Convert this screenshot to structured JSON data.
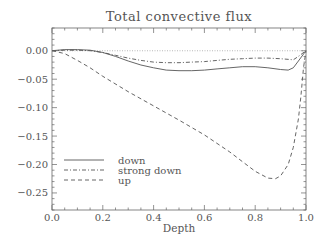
{
  "chart_data": {
    "type": "line",
    "title": "Total convective flux",
    "xlabel": "Depth",
    "ylabel": "",
    "xlim": [
      0.0,
      1.0
    ],
    "ylim": [
      -0.28,
      0.04
    ],
    "xticks": [
      "0.0",
      "0.2",
      "0.4",
      "0.6",
      "0.8",
      "1.0"
    ],
    "yticks": [
      "0.00",
      "-0.05",
      "-0.10",
      "-0.15",
      "-0.20",
      "-0.25"
    ],
    "grid": false,
    "legend_position": "lower left",
    "reference_line": {
      "y": 0.0,
      "style": "dotted"
    },
    "series": [
      {
        "name": "down",
        "style": "solid",
        "x": [
          0.0,
          0.05,
          0.1,
          0.15,
          0.2,
          0.25,
          0.3,
          0.35,
          0.4,
          0.45,
          0.5,
          0.55,
          0.6,
          0.65,
          0.7,
          0.75,
          0.8,
          0.85,
          0.9,
          0.93,
          0.95,
          0.97,
          1.0
        ],
        "values": [
          0.0,
          0.002,
          0.002,
          0.001,
          -0.003,
          -0.01,
          -0.018,
          -0.025,
          -0.03,
          -0.034,
          -0.035,
          -0.035,
          -0.034,
          -0.032,
          -0.03,
          -0.028,
          -0.028,
          -0.03,
          -0.033,
          -0.034,
          -0.03,
          -0.018,
          0.0
        ]
      },
      {
        "name": "strong down",
        "style": "dash-dot",
        "x": [
          0.0,
          0.05,
          0.1,
          0.15,
          0.2,
          0.25,
          0.3,
          0.35,
          0.4,
          0.45,
          0.5,
          0.55,
          0.6,
          0.65,
          0.7,
          0.75,
          0.8,
          0.85,
          0.9,
          0.95,
          0.97,
          1.0
        ],
        "values": [
          0.0,
          0.001,
          0.001,
          0.0,
          -0.003,
          -0.008,
          -0.013,
          -0.017,
          -0.02,
          -0.021,
          -0.021,
          -0.02,
          -0.019,
          -0.017,
          -0.015,
          -0.014,
          -0.013,
          -0.013,
          -0.014,
          -0.016,
          -0.01,
          0.0
        ]
      },
      {
        "name": "up",
        "style": "dashed",
        "x": [
          0.0,
          0.05,
          0.1,
          0.15,
          0.2,
          0.3,
          0.4,
          0.5,
          0.6,
          0.7,
          0.75,
          0.8,
          0.85,
          0.88,
          0.9,
          0.93,
          0.95,
          0.97,
          0.98,
          0.99,
          1.0
        ],
        "values": [
          0.0,
          -0.005,
          -0.017,
          -0.03,
          -0.045,
          -0.072,
          -0.097,
          -0.122,
          -0.148,
          -0.178,
          -0.195,
          -0.212,
          -0.224,
          -0.225,
          -0.22,
          -0.2,
          -0.17,
          -0.12,
          -0.08,
          -0.03,
          0.0
        ]
      }
    ]
  }
}
